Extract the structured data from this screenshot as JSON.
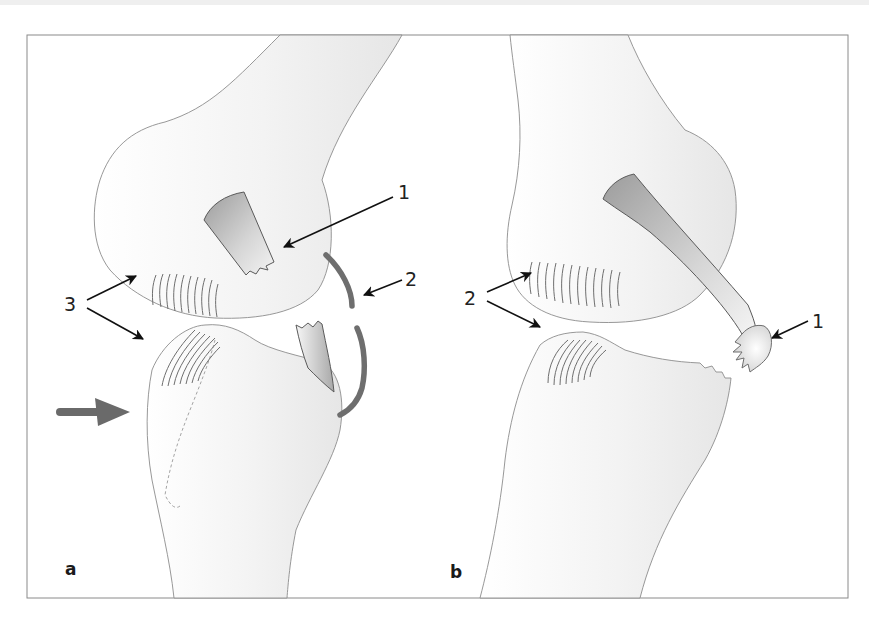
{
  "figure": {
    "colors": {
      "bone_fill": "#f2f2f2",
      "bone_outline": "#8c8c8c",
      "ligament_dark": "#9a9a9a",
      "meniscus": "#6e6e6e",
      "force_arrow": "#6a6a6a",
      "leader_lines": "#111111"
    },
    "panels": [
      {
        "id": "a",
        "label": "a",
        "callouts": [
          {
            "number": "1",
            "target": "torn ligament stump on femoral condyle"
          },
          {
            "number": "2",
            "target": "meniscus / capsule arc"
          },
          {
            "number": "3",
            "target": "articular cartilage contusion zones on femur and tibia"
          }
        ],
        "force_arrow": "lateral impact arrow pointing right"
      },
      {
        "id": "b",
        "label": "b",
        "callouts": [
          {
            "number": "1",
            "target": "avulsed bone fragment at ligament end"
          },
          {
            "number": "2",
            "target": "articular cartilage zones on femur and tibia"
          }
        ]
      }
    ]
  }
}
